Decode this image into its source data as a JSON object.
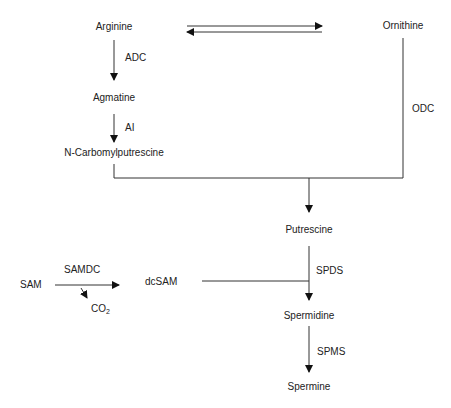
{
  "diagram": {
    "type": "metabolic-pathway",
    "nodes": {
      "arginine": "Arginine",
      "ornithine": "Ornithine",
      "agmatine": "Agmatine",
      "ncarbamoyl": "N-Carbomylputrescine",
      "putrescine": "Putrescine",
      "sam": "SAM",
      "dcsam": "dcSAM",
      "co2_base": "CO",
      "co2_sub": "2",
      "spermidine": "Spermidine",
      "spermine": "Spermine"
    },
    "enzymes": {
      "adc": "ADC",
      "ai": "AI",
      "odc": "ODC",
      "samdc": "SAMDC",
      "spds": "SPDS",
      "spms": "SPMS"
    },
    "edges": [
      {
        "from": "Arginine",
        "to": "Ornithine",
        "type": "reversible"
      },
      {
        "from": "Arginine",
        "to": "Agmatine",
        "enzyme": "ADC"
      },
      {
        "from": "Agmatine",
        "to": "N-Carbomylputrescine",
        "enzyme": "AI"
      },
      {
        "from": "N-Carbomylputrescine",
        "to": "Putrescine"
      },
      {
        "from": "Ornithine",
        "to": "Putrescine",
        "enzyme": "ODC"
      },
      {
        "from": "SAM",
        "to": "dcSAM",
        "enzyme": "SAMDC",
        "byproduct": "CO2"
      },
      {
        "from": "Putrescine",
        "to": "Spermidine",
        "enzyme": "SPDS",
        "cosubstrate": "dcSAM"
      },
      {
        "from": "Spermidine",
        "to": "Spermine",
        "enzyme": "SPMS"
      }
    ],
    "line_color": "#333333",
    "text_color": "#222222"
  }
}
